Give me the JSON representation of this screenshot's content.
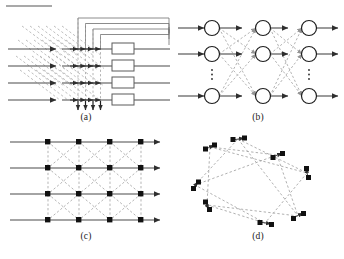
{
  "figure": {
    "background_color": "#ffffff",
    "line_color": "#3f3f3f",
    "dash_color": "#9a9a9a",
    "node_fill": "#ffffff",
    "node_stroke": "#1f1f1f",
    "square_node_fill": "#111111",
    "panels": [
      {
        "id": "a",
        "caption": "(a)",
        "description": "systolic array with delay boxes, diagonal broadcast lines and feedback paths",
        "num_rows": 4,
        "num_taps": 4,
        "num_boxes": 4,
        "num_feedback_loops": 4,
        "num_down_arrows": 4
      },
      {
        "id": "b",
        "caption": "(b)",
        "description": "multilayer feedforward neural network with three node layers and fully connected dashed links",
        "num_layers": 3,
        "nodes_per_layer": 3,
        "ellipsis_count": 2,
        "ellipsis_label": "⋮"
      },
      {
        "id": "c",
        "caption": "(c)",
        "description": "regular 4 by 4 mesh lattice with square nodes, dashed vertical and diagonal connections",
        "grid_rows": 4,
        "grid_cols": 4,
        "num_nodes": 16
      },
      {
        "id": "d",
        "caption": "(d)",
        "description": "irregular ring topology of paired nodes connected by dashed long range chords",
        "num_node_pairs": 8,
        "num_nodes": 16
      }
    ]
  }
}
